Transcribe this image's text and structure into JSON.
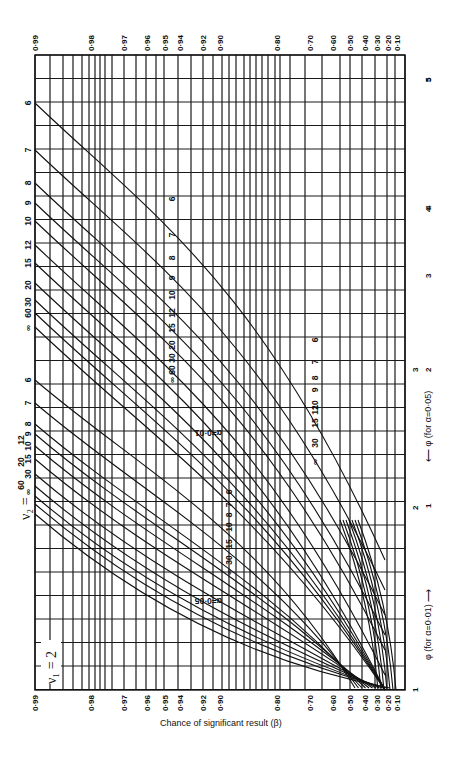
{
  "chart_data": {
    "type": "line",
    "orientation": "rotated 90° clockwise (β axis runs along page left-right, φ axis runs top-bottom)",
    "panel_label": "ν1 = 2",
    "nu2_label": "ν2 =",
    "ylabel": "Chance of significant result (β)",
    "xlabel_alpha_001": "φ (for α=0·01)",
    "xlabel_alpha_005": "φ (for α=0·05)",
    "beta_ticks": [
      "0·99",
      "0·98",
      "0·97",
      "0·96",
      "0·95",
      "0·94",
      "0·92",
      "0·90",
      "0·80",
      "0·70",
      "0·60",
      "0·50",
      "0·40",
      "0·30",
      "0·20",
      "0·10"
    ],
    "phi_ticks_alpha_001": [
      "1",
      "2",
      "3",
      "4",
      "5"
    ],
    "phi_ticks_alpha_005": [
      "1",
      "2",
      "3"
    ],
    "beta_range": [
      0.1,
      0.99
    ],
    "phi_range_alpha_001": [
      1,
      5.5
    ],
    "phi_range_alpha_005": [
      1,
      3.2
    ],
    "grid": true,
    "nu2_values": [
      "∞",
      "60",
      "30",
      "20",
      "15",
      "12",
      "10",
      "9",
      "8",
      "7",
      "6"
    ],
    "family_labels": {
      "alpha_005": "α=0·05",
      "alpha_001": "α=0·01"
    },
    "series": [
      {
        "family": "α=0·05",
        "nu2": "6",
        "phi": [
          1.0,
          1.5,
          2.0,
          2.5,
          3.0
        ],
        "beta": [
          0.18,
          0.43,
          0.7,
          0.88,
          0.96
        ]
      },
      {
        "family": "α=0·05",
        "nu2": "7",
        "phi": [
          1.0,
          1.5,
          2.0,
          2.5,
          3.0
        ],
        "beta": [
          0.19,
          0.46,
          0.74,
          0.91,
          0.97
        ]
      },
      {
        "family": "α=0·05",
        "nu2": "8",
        "phi": [
          1.0,
          1.5,
          2.0,
          2.5,
          3.0
        ],
        "beta": [
          0.2,
          0.48,
          0.76,
          0.92,
          0.98
        ]
      },
      {
        "family": "α=0·05",
        "nu2": "10",
        "phi": [
          1.0,
          1.5,
          2.0,
          2.5,
          3.0
        ],
        "beta": [
          0.21,
          0.51,
          0.79,
          0.94,
          0.985
        ]
      },
      {
        "family": "α=0·05",
        "nu2": "15",
        "phi": [
          1.0,
          1.5,
          2.0,
          2.5,
          3.0
        ],
        "beta": [
          0.22,
          0.54,
          0.83,
          0.96,
          0.99
        ]
      },
      {
        "family": "α=0·05",
        "nu2": "30",
        "phi": [
          1.0,
          1.5,
          2.0,
          2.5,
          3.0
        ],
        "beta": [
          0.24,
          0.58,
          0.86,
          0.97,
          0.995
        ]
      },
      {
        "family": "α=0·05",
        "nu2": "∞",
        "phi": [
          1.0,
          1.5,
          2.0,
          2.5,
          3.0
        ],
        "beta": [
          0.26,
          0.61,
          0.89,
          0.98,
          0.998
        ]
      },
      {
        "family": "α=0·01",
        "nu2": "6",
        "phi": [
          2.0,
          2.5,
          3.0,
          3.5,
          4.0,
          4.5,
          5.0
        ],
        "beta": [
          0.18,
          0.33,
          0.5,
          0.67,
          0.81,
          0.9,
          0.96
        ]
      },
      {
        "family": "α=0·01",
        "nu2": "7",
        "phi": [
          2.0,
          2.5,
          3.0,
          3.5,
          4.0,
          4.5
        ],
        "beta": [
          0.21,
          0.38,
          0.58,
          0.76,
          0.88,
          0.95
        ]
      },
      {
        "family": "α=0·01",
        "nu2": "8",
        "phi": [
          2.0,
          2.5,
          3.0,
          3.5,
          4.0,
          4.5
        ],
        "beta": [
          0.23,
          0.42,
          0.63,
          0.81,
          0.92,
          0.97
        ]
      },
      {
        "family": "α=0·01",
        "nu2": "10",
        "phi": [
          2.0,
          2.5,
          3.0,
          3.5,
          4.0
        ],
        "beta": [
          0.26,
          0.48,
          0.7,
          0.87,
          0.95
        ]
      },
      {
        "family": "α=0·01",
        "nu2": "15",
        "phi": [
          2.0,
          2.5,
          3.0,
          3.5,
          4.0
        ],
        "beta": [
          0.31,
          0.55,
          0.78,
          0.92,
          0.98
        ]
      },
      {
        "family": "α=0·01",
        "nu2": "30",
        "phi": [
          2.0,
          2.5,
          3.0,
          3.5
        ],
        "beta": [
          0.36,
          0.63,
          0.85,
          0.96
        ]
      },
      {
        "family": "α=0·01",
        "nu2": "∞",
        "phi": [
          2.0,
          2.5,
          3.0,
          3.5
        ],
        "beta": [
          0.41,
          0.7,
          0.9,
          0.98
        ]
      }
    ]
  },
  "labels": {
    "ylabel": "Chance of significant result (β)",
    "panel": "ν₁ = 2",
    "nu2": "ν₂ =",
    "alpha005": "α=0·05",
    "alpha001": "α=0·01",
    "phi001": "φ (for α=0·01) ⟶",
    "phi005": "⟵ φ (for α=0·05)"
  }
}
